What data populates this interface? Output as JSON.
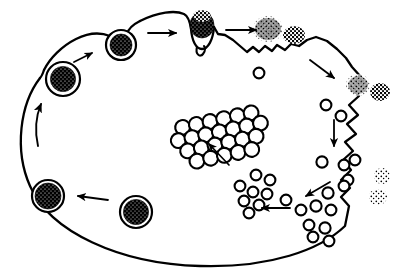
{
  "figure": {
    "type": "biological-line-diagram",
    "palette": {
      "ink": "#000000",
      "background": "#ffffff",
      "cargo_fill": "#000000",
      "vesicle_fill": "#ffffff"
    },
    "canvas": {
      "width": 403,
      "height": 277
    }
  },
  "cell": {
    "name": "cell-body",
    "outline_style": "closed oval with smooth left half and ruffled right edge",
    "membrane_stroke_width": 2.2
  },
  "elements": {
    "coated_vesicles": [
      {
        "id": "vesicle-top-left-inner",
        "cx": 63,
        "cy": 79,
        "r": 17,
        "cargo_r": 12.5,
        "label": "internalized coated vesicle"
      },
      {
        "id": "vesicle-upper-arc",
        "cx": 121,
        "cy": 45,
        "r": 15,
        "cargo_r": 11,
        "label": "budding coated vesicle"
      },
      {
        "id": "vesicle-bottom-left",
        "cx": 48,
        "cy": 196,
        "r": 16,
        "cargo_r": 13,
        "label": "cargo-laden vesicle"
      },
      {
        "id": "vesicle-bottom-mid",
        "cx": 136,
        "cy": 212,
        "r": 16,
        "cargo_r": 12.5,
        "label": "cargo-laden vesicle"
      }
    ],
    "membrane_pits": [
      {
        "id": "phagocytic-cup-top",
        "cx": 202,
        "cy": 27,
        "label": "invaginating coated pit with cargo"
      },
      {
        "id": "membrane-ruffle-upper-right",
        "label": "ruffled membrane region"
      }
    ],
    "extracellular_particles": [
      {
        "id": "particle-top-right-a",
        "cx": 268,
        "cy": 29,
        "r": 12,
        "density": "dense",
        "label": "extracellular ligand aggregate"
      },
      {
        "id": "particle-top-right-b",
        "cx": 295,
        "cy": 35,
        "r": 10,
        "density": "medium",
        "label": "extracellular ligand aggregate"
      },
      {
        "id": "particle-right-a",
        "cx": 359,
        "cy": 85,
        "r": 10,
        "density": "dense",
        "label": "extracellular ligand aggregate"
      },
      {
        "id": "particle-right-b",
        "cx": 380,
        "cy": 92,
        "r": 9,
        "density": "medium",
        "label": "extracellular ligand aggregate"
      },
      {
        "id": "particle-lower-right-a",
        "cx": 382,
        "cy": 176,
        "r": 8,
        "density": "sparse",
        "label": "dispersing ligand"
      },
      {
        "id": "particle-lower-right-b",
        "cx": 379,
        "cy": 196,
        "r": 8,
        "density": "sparse",
        "label": "dispersing ligand"
      }
    ],
    "crystalline_array": {
      "id": "central-lattice",
      "label": "ordered receptor/particle lattice",
      "rows": 4,
      "columns": 8,
      "circle_radius": 7.5,
      "center": {
        "x": 219,
        "y": 135
      },
      "rotation_deg": -12
    },
    "free_vesicle_clusters": [
      {
        "id": "cluster-center-bottom",
        "count": 9,
        "label": "clustering uncoated vesicles",
        "center": {
          "x": 262,
          "y": 196
        }
      },
      {
        "id": "cluster-right-lower",
        "count": 10,
        "label": "uncoated vesicles near membrane",
        "center": {
          "x": 318,
          "y": 210
        }
      },
      {
        "id": "cluster-right-mid",
        "count": 6,
        "label": "uncoated vesicles",
        "center": {
          "x": 338,
          "y": 168
        }
      },
      {
        "id": "cluster-right-upper",
        "count": 4,
        "label": "newly pinched vesicles",
        "center": {
          "x": 330,
          "y": 110
        }
      },
      {
        "id": "cluster-top-center",
        "count": 3,
        "label": "pinched vesicles below pit",
        "center": {
          "x": 262,
          "y": 72
        }
      }
    ],
    "arrows": [
      {
        "id": "arrow-left-upward",
        "direction": "up",
        "label": "recycling flow"
      },
      {
        "id": "arrow-upper-left-diagonal",
        "direction": "up-right",
        "label": "vesicle transport"
      },
      {
        "id": "arrow-top-left-horizontal",
        "direction": "right",
        "label": "vesicle transport"
      },
      {
        "id": "arrow-top-right-horizontal",
        "direction": "right",
        "label": "cargo uptake"
      },
      {
        "id": "arrow-upper-right-diagonal",
        "direction": "down-right",
        "label": "membrane ruffling flow"
      },
      {
        "id": "arrow-right-down",
        "direction": "down",
        "label": "vesicle movement inward"
      },
      {
        "id": "arrow-lower-right-diagonal",
        "direction": "down-left",
        "label": "vesicle movement"
      },
      {
        "id": "arrow-bottom-horizontal",
        "direction": "left",
        "label": "vesicle movement"
      },
      {
        "id": "arrow-center-to-lattice",
        "direction": "up-left",
        "label": "vesicles assemble into lattice"
      },
      {
        "id": "arrow-bottom-left-horizontal",
        "direction": "left",
        "label": "vesicle maturation"
      }
    ]
  }
}
